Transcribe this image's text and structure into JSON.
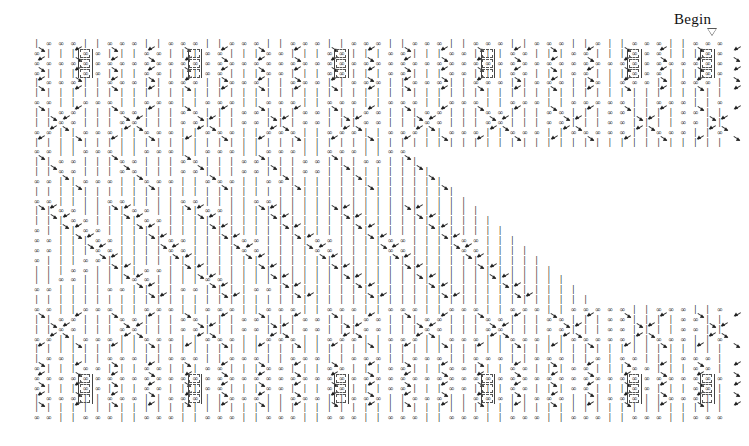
{
  "page": {
    "width": 749,
    "height": 446,
    "background": "#ffffff",
    "ink": "#1a1a1a"
  },
  "annotation": {
    "begin_label": "Begin",
    "begin_label_x": 674,
    "begin_label_y": 11,
    "marker_icon": "triangle-down-icon",
    "marker_x": 707,
    "marker_y": 28
  },
  "lattice": {
    "origin_x": 36,
    "origin_y": 44,
    "col_step": 12.2,
    "row_step": 9.85,
    "cols": 57,
    "rows": 39,
    "glyphs": {
      "infinity": "∞",
      "tick": "|",
      "empty": ""
    },
    "legend": [
      {
        "symbol": "∞",
        "name": "state-infinity"
      },
      {
        "symbol": "|",
        "name": "state-tick"
      }
    ],
    "rows_data": [
      "|.##.##.##.|.|.##.##.##.|.|.##.##.##.|.|.##.##.##.|.|.##.##.##.|.|.##.##.##.|.|.##.##.##.|.|.##.##.##.|.|.##.##.##.|.|.##.",
      "##.|.|.|.##.##.|.|.|.##.##.|.|.|.##.##.|.|.|.##.##.|.|.|.##.##.|.|.|.##.##.|.|.|.##.##.|.|.|.##.##.|.|.|.##.##.|.|.|.##.##",
      "##.##.##.##.##.##.##.##.##.##.##.##.##.##.##.##.##.##.##.##.##.##.##.##.##.##.##.##.##.##.##.##.##.##.##.##.##.##.##.##.##",
      "##.|.|.|.##.##.|.|.|.##.##.|.|.|.##.##.|.|.|.##.##.|.|.|.##.##.|.|.|.##.##.|.|.|.##.##.|.|.|.##.##.|.|.|.##.##.|.|.|.##.##",
      "|.##.##.##.|.|.##.##.##.|.|.##.##.##.|.|.##.##.##.|.|.##.##.##.|.|.##.##.##.|.|.##.##.##.|.|.##.##.##.|.|.##.##.##.|.|.##",
      "|.|.|.|.|.|.|.|.|.|.|.|.|.|.|.|.|.|.|.|.|.|.|.|.|.|.|.|.|.|.|.|.|.|.|.|.|.|.|.|.|.|.|.|.|.|.|.|.|.|.|.|.|.|.|.|.|.|.|.|.|",
      "##.##.|.|.##.##.##.|.|.##.##.##.|.|.##.##.##.|.|.##.##.##.|.|.##.##.##.|.|.##.##.##.|.|.##.##.##.|.|.##.##.##.|.|.##.##.##",
      "|.|.##.##.|.|.|.##.##.|.|.|.##.##.|.|.|.##.##.|.|.|.##.##.|.|.|.##.##.|.|.|.##.##.|.|.|.##.##.|.|.|.##.##.|.|.|.##.##.|.|",
      "|.|.##.##.|.|.|.##.##.|.|.|.##.##.|.|.|.##.##.|.|.|.##.##.|.|.|.##.##.|.|.|.##.##.|.|.|.##.##.|.|.|.##.##.|.|.|.##.##.|.|",
      "##.##.|.|.##.##.##.|.|.##.##.##.|.|.##.##.##.|.|.##.##.##.|.|.##.##.##.|.|.##.##.##.|.|.##.##.##.|.|.##.##.##.|.|.##.##.##",
      "|.|.|.|.|.|.|.|.|.|.|.|.|.|.|.|.|.|.|.|.|.|.|.|.|.|.|.|.|.|.|.|.|.|.|.|.|.|.|.|.|.|.|.|.|.|.|.|.|.|.|.|.|.|.|.|.|.|.|.|.|",
      "##.##.|.|.##.##.##.|.|.##.##.##.|.|.##.##.##.|.|.##.##.##.|.|.##.##.##.|.|.##.##.|.|.|.|.|.|.|.|.|.|.|.|.|.|.|.|.|.|.|.|",
      "|.|.##.##.|.|.|.##.##.|.|.|.##.##.|.|.|.##.##.|.|.|.##.##.|.|.|.##.##.|.|.|.|.|.|.|.|.|.|.|.|.|.|.|.|.|.|.|.|.|.|.|.|.|.|",
      "|.|.##.##.|.|.|.##.##.|.|.|.##.##.|.|.|.##.##.|.|.|.##.##.|.|.|.|.|.|.|.|.|.|.|.|.|.|.|.|.|.|.|.|.|.|.|.|.|.|.|.|.|.|.|.|",
      "##.##.|.|.##.##.##.|.|.##.##.##.|.|.##.##.##.|.|.##.##.|.|.|.|.|.|.|.|.|.|.|.|.|.|.|.|.|.|.|.|.|.|.|.|.|.|.|.|.|.|.|.|.|",
      "|.|.|.|.|.|.|.|.|.|.|.|.|.|.|.|.|.|.|.|.|.|.|.|.|.|.|.|.|.|.|.|.|.|.|.|.|.|.|.|.|.|.|.|.|.|.|.|.|.|.|.|.|.|.|.|.|.|.|.|.|",
      "##.##.|.|.|.|.##.##.|.|.|.|.##.##.|.|.|.|.##.##.|.|.|.|.|.|.|.|.|.|.|.|.|.|.|.|.|.|.|.|.|.|.|.|.|.|.|.|.|.|.|.|.|.|.|.|.|",
      "|.|.##.##.|.|.|.|.##.##.|.|.|.|.##.##.|.|.|.|.|.|.|.|.|.|.|.|.|.|.|.|.|.|.|.|.|.|.|.|.|.|.|.|.|.|.|.|.|.|.|.|.|.|.|.|.|.|",
      "|.|.|.##.##.|.|.|.|.##.##.|.|.|.|.|.|.|.|.|.|.|.|.|.|.|.|.|.|.|.|.|.|.|.|.|.|.|.|.|.|.|.|.|.|.|.|.|.|.|.|.|.|.|.|.|.|.|.|",
      "##.|.|.|.##.##.|.|.|.|.|.|.|.|.|.|.|.|.|.|.|.|.|.|.|.|.|.|.|.|.|.|.|.|.|.|.|.|.|.|.|.|.|.|.|.|.|.|.|.|.|.|.|.|.|.|.|.|.|",
      "##.##.|.|.|.##.##.|.|.|.|.##.##.|.|.|.|.##.##.|.|.|.|.##.##.|.|.|.|.##.##.|.|.|.|.##.##.|.|.|.|.##.##.|.|.|.|.##.##.|.|.|",
      "##.##.|.|.|.##.##.|.|.|.|.##.##.|.|.|.|.##.##.|.|.|.|.##.##.|.|.|.|.##.##.|.|.|.|.##.##.|.|.|.|.##.##.|.|.|.|.##.##.|.|.|",
      "##.|.|.|.##.##.|.|.|.|.|.|.|.|.|.|.|.|.|.|.|.|.|.|.|.|.|.|.|.|.|.|.|.|.|.|.|.|.|.|.|.|.|.|.|.|.|.|.|.|.|.|.|.|.|.|.|.|.|",
      "|.|.|.##.##.|.|.|.|.##.##.|.|.|.|.|.|.|.|.|.|.|.|.|.|.|.|.|.|.|.|.|.|.|.|.|.|.|.|.|.|.|.|.|.|.|.|.|.|.|.|.|.|.|.|.|.|.|.|",
      "|.|.##.##.|.|.|.|.##.##.|.|.|.|.##.##.|.|.|.|.|.|.|.|.|.|.|.|.|.|.|.|.|.|.|.|.|.|.|.|.|.|.|.|.|.|.|.|.|.|.|.|.|.|.|.|.|.|",
      "##.##.|.|.|.|.##.##.|.|.|.|.##.##.|.|.|.|.##.##.|.|.|.|.|.|.|.|.|.|.|.|.|.|.|.|.|.|.|.|.|.|.|.|.|.|.|.|.|.|.|.|.|.|.|.|.|",
      "|.|.|.|.|.|.|.|.|.|.|.|.|.|.|.|.|.|.|.|.|.|.|.|.|.|.|.|.|.|.|.|.|.|.|.|.|.|.|.|.|.|.|.|.|.|.|.|.|.|.|.|.|.|.|.|.|.|.|.|.|",
      "##.##.|.|.##.##.##.|.|.##.##.##.|.|.##.##.##.|.|.##.##.##.|.|.##.##.##.|.|.##.##.##.|.|.##.##.##.|.|.##.##.##.|.|.##.##.##",
      "|.|.##.##.|.|.|.##.##.|.|.|.##.##.|.|.|.##.##.|.|.|.##.##.|.|.|.##.##.|.|.|.##.##.|.|.|.##.##.|.|.|.##.##.|.|.|.##.##.|.|",
      "|.|.##.##.|.|.|.##.##.|.|.|.##.##.|.|.|.##.##.|.|.|.##.##.|.|.|.##.##.|.|.|.##.##.|.|.|.##.##.|.|.|.##.##.|.|.|.##.##.|.|",
      "##.##.|.|.##.##.##.|.|.##.##.##.|.|.##.##.##.|.|.##.##.##.|.|.##.##.##.|.|.##.##.##.|.|.##.##.##.|.|.##.##.##.|.|.##.##.##",
      "|.|.|.|.|.|.|.|.|.|.|.|.|.|.|.|.|.|.|.|.|.|.|.|.|.|.|.|.|.|.|.|.|.|.|.|.|.|.|.|.|.|.|.|.|.|.|.|.|.|.|.|.|.|.|.|.|.|.|.|.|",
      "|.##.##.|.|.|.##.##.##.|.|.##.##.##.|.|.##.##.##.|.|.##.##.##.|.|.##.##.##.|.|.##.##.##.|.|.##.##.##.|.|.##.##.##.|.|.##",
      "##.|.|.|.##.##.|.|.|.##.##.|.|.|.##.##.|.|.|.##.##.|.|.|.##.##.|.|.|.##.##.|.|.|.##.##.|.|.|.##.##.|.|.|.##.##.|.|.|.##",
      "##.##.##.##.##.##.##.##.##.##.##.##.##.##.##.##.##.##.##.##.##.##.##.##.##.##.##.##.##.##.##.##.##.##.##.##.##.##.##.##",
      "##.|.|.|.##.##.|.|.|.##.##.|.|.|.##.##.|.|.|.##.##.|.|.|.##.##.|.|.|.##.##.|.|.|.##.##.|.|.|.##.##.|.|.|.##.##.|.|.|.##",
      "|.##.##.##.|.|.##.##.##.|.|.##.##.##.|.|.##.##.##.|.|.##.##.##.|.|.##.##.##.|.|.##.##.##.|.|.##.##.##.|.|.##.##.##.|.|",
      "|.|.|.|.|.|.|.|.|.|.|.|.|.|.|.|.|.|.|.|.|.|.|.|.|.|.|.|.|.|.|.|.|.|.|.|.|.|.|.|.|.|.|.|.|.|.|.|.|.|.|.|.|.|.|.|.|.|.|.|",
      "##.##.|.|.##.##.##.|.|.##.##.##.|.|.##.##.##.|.|.##.##.##.|.|.##.##.##.|.|.##.##.##.|.|.##.##.##.|.|.##.##.##.|.|.##"
    ],
    "blank_wedge": {
      "description": "white triangular region, right-of-diagonal, no glyphs",
      "start_row": 11,
      "end_row": 26,
      "apex_col": 30,
      "slope_cols_per_row": 1
    },
    "boxes": [
      {
        "row": 1,
        "col": 13
      },
      {
        "row": 1,
        "col": 25
      },
      {
        "row": 1,
        "col": 37
      },
      {
        "row": 1,
        "col": 49
      },
      {
        "row": 1,
        "col": 4
      },
      {
        "row": 1,
        "col": 55
      },
      {
        "row": 2,
        "col": 13
      },
      {
        "row": 2,
        "col": 25
      },
      {
        "row": 2,
        "col": 37
      },
      {
        "row": 2,
        "col": 49
      },
      {
        "row": 2,
        "col": 4
      },
      {
        "row": 2,
        "col": 55
      },
      {
        "row": 3,
        "col": 13
      },
      {
        "row": 3,
        "col": 25
      },
      {
        "row": 3,
        "col": 37
      },
      {
        "row": 3,
        "col": 49
      },
      {
        "row": 3,
        "col": 4
      },
      {
        "row": 3,
        "col": 55
      },
      {
        "row": 34,
        "col": 13
      },
      {
        "row": 34,
        "col": 25
      },
      {
        "row": 34,
        "col": 37
      },
      {
        "row": 34,
        "col": 49
      },
      {
        "row": 34,
        "col": 4
      },
      {
        "row": 34,
        "col": 55
      },
      {
        "row": 35,
        "col": 13
      },
      {
        "row": 35,
        "col": 25
      },
      {
        "row": 35,
        "col": 37
      },
      {
        "row": 35,
        "col": 49
      },
      {
        "row": 35,
        "col": 4
      },
      {
        "row": 35,
        "col": 55
      },
      {
        "row": 36,
        "col": 13
      },
      {
        "row": 36,
        "col": 25
      },
      {
        "row": 36,
        "col": 37
      },
      {
        "row": 36,
        "col": 49
      },
      {
        "row": 36,
        "col": 4
      },
      {
        "row": 36,
        "col": 55
      }
    ],
    "arrow_bands": [
      {
        "name": "top-band",
        "rows": [
          0,
          1,
          2,
          3,
          4
        ],
        "style": "lattice-zigzag",
        "period": 6
      },
      {
        "name": "upper-diamond",
        "rows": [
          6,
          7,
          8,
          9
        ],
        "style": "diamond",
        "period": 6
      },
      {
        "name": "expanding-front",
        "rows": [
          11,
          12,
          13,
          14
        ],
        "style": "diagonal-right",
        "period": 6
      },
      {
        "name": "wave-core",
        "rows": [
          16,
          17,
          18,
          19,
          20,
          21,
          22,
          23,
          24,
          25
        ],
        "style": "chevron",
        "period": 6
      },
      {
        "name": "lower-diamond",
        "rows": [
          27,
          28,
          29,
          30
        ],
        "style": "diamond",
        "period": 6
      },
      {
        "name": "bottom-band",
        "rows": [
          32,
          33,
          34,
          35,
          36
        ],
        "style": "lattice-zigzag",
        "period": 6
      }
    ]
  }
}
